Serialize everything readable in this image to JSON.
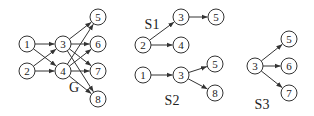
{
  "colors": {
    "stroke": "#333333",
    "text": "#222222",
    "background": "#ffffff"
  },
  "node_radius": 8,
  "graphs": [
    {
      "id": "G",
      "label": "G",
      "label_pos": [
        74,
        92
      ],
      "nodes": [
        {
          "id": "1",
          "label": "1",
          "x": 27,
          "y": 44
        },
        {
          "id": "2",
          "label": "2",
          "x": 27,
          "y": 71
        },
        {
          "id": "3",
          "label": "3",
          "x": 63,
          "y": 44
        },
        {
          "id": "4",
          "label": "4",
          "x": 63,
          "y": 71
        },
        {
          "id": "5",
          "label": "5",
          "x": 98,
          "y": 17
        },
        {
          "id": "6",
          "label": "6",
          "x": 98,
          "y": 44
        },
        {
          "id": "7",
          "label": "7",
          "x": 98,
          "y": 71
        },
        {
          "id": "8",
          "label": "8",
          "x": 98,
          "y": 99
        }
      ],
      "edges": [
        [
          "1",
          "3"
        ],
        [
          "1",
          "4"
        ],
        [
          "2",
          "3"
        ],
        [
          "2",
          "4"
        ],
        [
          "3",
          "5"
        ],
        [
          "3",
          "6"
        ],
        [
          "3",
          "7"
        ],
        [
          "3",
          "8"
        ],
        [
          "4",
          "5"
        ],
        [
          "4",
          "6"
        ],
        [
          "4",
          "7"
        ],
        [
          "4",
          "8"
        ]
      ]
    },
    {
      "id": "S1",
      "label": "S1",
      "label_pos": [
        152,
        29
      ],
      "nodes": [
        {
          "id": "2",
          "label": "2",
          "x": 143,
          "y": 45
        },
        {
          "id": "3",
          "label": "3",
          "x": 181,
          "y": 17
        },
        {
          "id": "4",
          "label": "4",
          "x": 181,
          "y": 45
        },
        {
          "id": "5",
          "label": "5",
          "x": 216,
          "y": 17
        }
      ],
      "edges": [
        [
          "2",
          "3"
        ],
        [
          "2",
          "4"
        ],
        [
          "3",
          "5"
        ]
      ]
    },
    {
      "id": "S2",
      "label": "S2",
      "label_pos": [
        172,
        105
      ],
      "nodes": [
        {
          "id": "1",
          "label": "1",
          "x": 143,
          "y": 75
        },
        {
          "id": "3",
          "label": "3",
          "x": 181,
          "y": 75
        },
        {
          "id": "5",
          "label": "5",
          "x": 215,
          "y": 64
        },
        {
          "id": "8",
          "label": "8",
          "x": 215,
          "y": 93
        }
      ],
      "edges": [
        [
          "1",
          "3"
        ],
        [
          "3",
          "5"
        ],
        [
          "3",
          "8"
        ]
      ]
    },
    {
      "id": "S3",
      "label": "S3",
      "label_pos": [
        262,
        109
      ],
      "nodes": [
        {
          "id": "3",
          "label": "3",
          "x": 255,
          "y": 66
        },
        {
          "id": "5",
          "label": "5",
          "x": 289,
          "y": 39
        },
        {
          "id": "6",
          "label": "6",
          "x": 289,
          "y": 66
        },
        {
          "id": "7",
          "label": "7",
          "x": 289,
          "y": 93
        }
      ],
      "edges": [
        [
          "3",
          "5"
        ],
        [
          "3",
          "6"
        ],
        [
          "3",
          "7"
        ]
      ]
    }
  ]
}
